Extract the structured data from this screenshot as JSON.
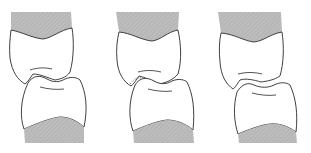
{
  "diagram": {
    "title": "",
    "panels": [
      {
        "id": "left",
        "description": "upper and lower tooth in occlusion"
      },
      {
        "id": "middle",
        "description": "upper and lower tooth in occlusion with dotted contact outline"
      },
      {
        "id": "right",
        "description": "upper and lower tooth slightly separated"
      }
    ],
    "colors": {
      "gum": "#b5b5b5",
      "outline": "#2a2a2a",
      "tooth": "#ffffff"
    }
  }
}
